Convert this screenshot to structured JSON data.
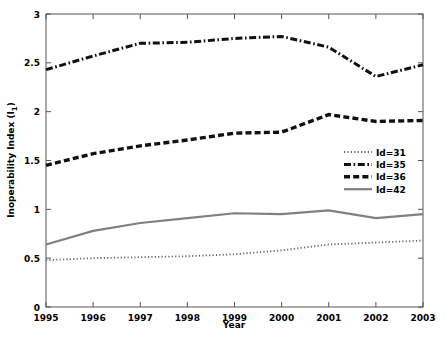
{
  "chart_data": {
    "type": "line",
    "title": "",
    "xlabel": "Year",
    "ylabel": "Inoperability Index (I_1)",
    "ylabel_base": "Inoperability Index (I",
    "ylabel_sub": "1",
    "ylabel_tail": ")",
    "x": [
      1995,
      1996,
      1997,
      1998,
      1999,
      2000,
      2001,
      2002,
      2003
    ],
    "xtick_labels": [
      "1995",
      "1996",
      "1997",
      "1998",
      "1999",
      "2000",
      "2001",
      "2002",
      "2003"
    ],
    "ytick_labels": [
      "0",
      "0.5",
      "1",
      "1.5",
      "2",
      "2.5",
      "3"
    ],
    "ytick_values": [
      0,
      0.5,
      1,
      1.5,
      2,
      2.5,
      3
    ],
    "xlim": [
      1995,
      2003
    ],
    "ylim": [
      0,
      3
    ],
    "grid": false,
    "legend_position": "center-right",
    "series": [
      {
        "name": "Id=31",
        "label": "Id=31",
        "linestyle": "dotted",
        "color": "#666666",
        "values": [
          0.48,
          0.5,
          0.51,
          0.52,
          0.54,
          0.58,
          0.64,
          0.66,
          0.68
        ]
      },
      {
        "name": "Id=35",
        "label": "Id=35",
        "linestyle": "dashdot",
        "color": "#111111",
        "values": [
          2.43,
          2.57,
          2.7,
          2.71,
          2.75,
          2.77,
          2.66,
          2.36,
          2.48
        ]
      },
      {
        "name": "Id=36",
        "label": "Id=36",
        "linestyle": "dashed",
        "color": "#111111",
        "values": [
          1.45,
          1.57,
          1.65,
          1.71,
          1.78,
          1.79,
          1.97,
          1.9,
          1.91
        ]
      },
      {
        "name": "Id=42",
        "label": "Id=42",
        "linestyle": "solid",
        "color": "#808080",
        "values": [
          0.64,
          0.78,
          0.86,
          0.91,
          0.96,
          0.95,
          0.99,
          0.91,
          0.95
        ]
      }
    ]
  }
}
